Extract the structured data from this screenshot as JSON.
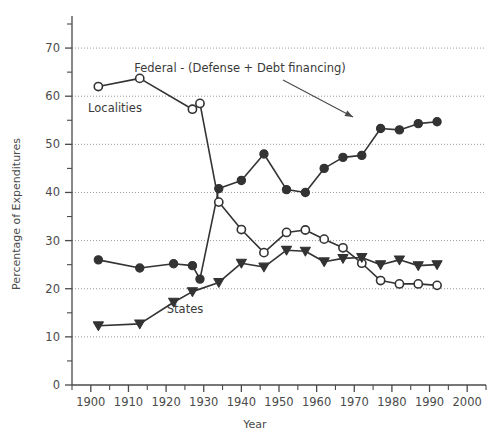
{
  "chart_data": {
    "type": "line",
    "title": "",
    "xlabel": "Year",
    "ylabel": "Percentage of Expenditures",
    "xlim": [
      1895,
      2005
    ],
    "ylim": [
      0,
      75
    ],
    "xticks": [
      1900,
      1910,
      1920,
      1930,
      1940,
      1950,
      1960,
      1970,
      1980,
      1990,
      2000
    ],
    "xticklabels": [
      "1900",
      "1910",
      "1920",
      "1930",
      "1940",
      "1950",
      "1960",
      "1970",
      "1980",
      "1990",
      "2000"
    ],
    "xminorticks": [
      1895,
      1905,
      1915,
      1925,
      1935,
      1945,
      1955,
      1965,
      1975,
      1985,
      1995,
      2005
    ],
    "yticks": [
      0,
      10,
      20,
      30,
      40,
      50,
      60,
      70
    ],
    "yticklabels": [
      "0",
      "10",
      "20",
      "30",
      "40",
      "50",
      "60",
      "70"
    ],
    "yminorticks": [
      5,
      15,
      25,
      35,
      45,
      55,
      65,
      75
    ],
    "grid": "horizontal-dotted",
    "legend_position": "inline-annotations",
    "series": [
      {
        "name": "Federal - (Defense + Debt financing)",
        "marker": "filled-circle",
        "color": "#333333",
        "points": [
          {
            "x": 1902,
            "y": 26.0
          },
          {
            "x": 1913,
            "y": 24.3
          },
          {
            "x": 1922,
            "y": 25.2
          },
          {
            "x": 1927,
            "y": 24.8
          },
          {
            "x": 1929,
            "y": 22.0
          },
          {
            "x": 1934,
            "y": 40.8
          },
          {
            "x": 1940,
            "y": 42.5
          },
          {
            "x": 1946,
            "y": 48.0
          },
          {
            "x": 1952,
            "y": 40.6
          },
          {
            "x": 1957,
            "y": 40.0
          },
          {
            "x": 1962,
            "y": 45.0
          },
          {
            "x": 1967,
            "y": 47.3
          },
          {
            "x": 1972,
            "y": 47.7
          },
          {
            "x": 1977,
            "y": 53.3
          },
          {
            "x": 1982,
            "y": 53.0
          },
          {
            "x": 1987,
            "y": 54.3
          },
          {
            "x": 1992,
            "y": 54.7
          }
        ]
      },
      {
        "name": "Localities",
        "marker": "open-circle",
        "color": "#333333",
        "points": [
          {
            "x": 1902,
            "y": 62.0
          },
          {
            "x": 1913,
            "y": 63.7
          },
          {
            "x": 1927,
            "y": 57.3
          },
          {
            "x": 1929,
            "y": 58.5
          },
          {
            "x": 1934,
            "y": 38.0
          },
          {
            "x": 1940,
            "y": 32.3
          },
          {
            "x": 1946,
            "y": 27.5
          },
          {
            "x": 1952,
            "y": 31.7
          },
          {
            "x": 1957,
            "y": 32.2
          },
          {
            "x": 1962,
            "y": 30.3
          },
          {
            "x": 1967,
            "y": 28.5
          },
          {
            "x": 1972,
            "y": 25.3
          },
          {
            "x": 1977,
            "y": 21.7
          },
          {
            "x": 1982,
            "y": 21.0
          },
          {
            "x": 1987,
            "y": 21.0
          },
          {
            "x": 1992,
            "y": 20.7
          }
        ]
      },
      {
        "name": "States",
        "marker": "filled-triangle-down",
        "color": "#333333",
        "points": [
          {
            "x": 1902,
            "y": 12.3
          },
          {
            "x": 1913,
            "y": 12.7
          },
          {
            "x": 1922,
            "y": 17.2
          },
          {
            "x": 1927,
            "y": 19.4
          },
          {
            "x": 1934,
            "y": 21.3
          },
          {
            "x": 1940,
            "y": 25.3
          },
          {
            "x": 1946,
            "y": 24.5
          },
          {
            "x": 1952,
            "y": 28.0
          },
          {
            "x": 1957,
            "y": 27.8
          },
          {
            "x": 1962,
            "y": 25.6
          },
          {
            "x": 1967,
            "y": 26.3
          },
          {
            "x": 1972,
            "y": 26.5
          },
          {
            "x": 1977,
            "y": 25.0
          },
          {
            "x": 1982,
            "y": 26.0
          },
          {
            "x": 1987,
            "y": 24.8
          },
          {
            "x": 1992,
            "y": 25.0
          }
        ]
      }
    ],
    "annotations": [
      {
        "id": "federal-annotation",
        "text": "Federal - (Defense + Debt financing)",
        "text_x": 240,
        "text_y": 72,
        "arrow_from_x": 283,
        "arrow_from_y": 80,
        "arrow_to_x": 358,
        "arrow_to_y": 120
      },
      {
        "id": "localities-label",
        "text": "Localities",
        "text_x": 115,
        "text_y": 112
      },
      {
        "id": "states-label",
        "text": "States",
        "text_x": 185,
        "text_y": 313
      }
    ]
  }
}
